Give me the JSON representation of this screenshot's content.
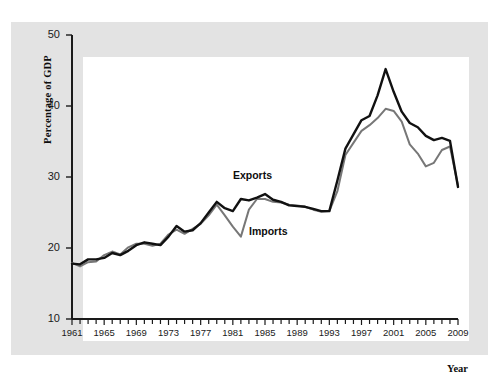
{
  "chart_data": {
    "type": "line",
    "title": "",
    "xlabel": "Year",
    "ylabel": "Percentage of GDP",
    "xlim": [
      1961,
      2009
    ],
    "ylim": [
      10,
      50
    ],
    "ytick_labels": [
      "10",
      "20",
      "30",
      "40",
      "50"
    ],
    "ytick_values": [
      10,
      20,
      30,
      40,
      50
    ],
    "xtick_labels": [
      "1961",
      "1965",
      "1969",
      "1973",
      "1977",
      "1981",
      "1985",
      "1989",
      "1993",
      "1997",
      "2001",
      "2005",
      "2009"
    ],
    "xtick_values": [
      1961,
      1965,
      1969,
      1973,
      1977,
      1981,
      1985,
      1989,
      1993,
      1997,
      2001,
      2005,
      2009
    ],
    "grid": false,
    "legend_position": "inline-annotation",
    "x": [
      1961,
      1962,
      1963,
      1964,
      1965,
      1966,
      1967,
      1968,
      1969,
      1970,
      1971,
      1972,
      1973,
      1974,
      1975,
      1976,
      1977,
      1978,
      1979,
      1980,
      1981,
      1982,
      1983,
      1984,
      1985,
      1986,
      1987,
      1988,
      1989,
      1990,
      1991,
      1992,
      1993,
      1994,
      1995,
      1996,
      1997,
      1998,
      1999,
      2000,
      2001,
      2002,
      2003,
      2004,
      2005,
      2006,
      2007,
      2008,
      2009
    ],
    "series": [
      {
        "name": "Exports",
        "color": "#111111",
        "width": 2.4,
        "values": [
          17.8,
          17.7,
          18.4,
          18.4,
          18.6,
          19.3,
          19.0,
          19.6,
          20.4,
          20.8,
          20.6,
          20.4,
          21.6,
          23.1,
          22.3,
          22.5,
          23.5,
          25.0,
          26.5,
          25.6,
          25.2,
          26.9,
          26.7,
          27.1,
          27.6,
          26.8,
          26.5,
          26.0,
          25.9,
          25.8,
          25.5,
          25.2,
          25.2,
          29.5,
          34.0,
          36.0,
          38.0,
          38.6,
          41.5,
          45.2,
          42.0,
          39.2,
          37.6,
          37.0,
          35.8,
          35.2,
          35.5,
          35.1,
          28.6
        ]
      },
      {
        "name": "Imports",
        "color": "#777777",
        "width": 2.0,
        "values": [
          17.9,
          17.4,
          18.0,
          18.1,
          19.0,
          19.5,
          19.1,
          20.1,
          20.6,
          20.6,
          20.3,
          20.6,
          21.9,
          22.6,
          22.0,
          22.7,
          23.4,
          24.6,
          26.1,
          24.6,
          23.0,
          21.6,
          25.4,
          26.9,
          26.9,
          26.5,
          26.4,
          26.1,
          26.0,
          25.8,
          25.4,
          25.1,
          25.2,
          28.0,
          33.1,
          34.8,
          36.5,
          37.3,
          38.3,
          39.6,
          39.3,
          37.8,
          34.6,
          33.3,
          31.5,
          32.0,
          33.8,
          34.3,
          28.8
        ]
      }
    ],
    "annotations": [
      {
        "text": "Exports",
        "x": 1984,
        "y": 30.2
      },
      {
        "text": "Imports",
        "x": 1986,
        "y": 22.3
      }
    ]
  },
  "axis": {
    "y_title": "Percentage of GDP",
    "x_title": "Year"
  }
}
